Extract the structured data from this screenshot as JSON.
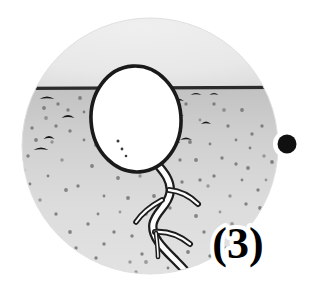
{
  "figure": {
    "stage_label": "(3)",
    "caption_text": "(3)",
    "scene_kind": "cross-section-soil-circle",
    "colors": {
      "background": "#ffffff",
      "sky": "#e9e9e9",
      "sky_edge": "#dcdcdc",
      "soil_top": "#c2c2c2",
      "soil_bottom": "#e2e2e2",
      "soil_line": "#2b2b2b",
      "outline": "#1a1a1a",
      "seed_fill": "#ffffff",
      "root_fill": "#fdfdfd",
      "speckle": "#6f6f6f",
      "pebble": "#171717",
      "bullet_dot": "#101010",
      "halo": "#ffffff",
      "caption_fill": "#000000"
    },
    "circle": {
      "cx": 150,
      "cy": 146,
      "r": 128
    },
    "soil_line_y": 88,
    "seed": {
      "name": "seed",
      "cx": 136,
      "cy": 119,
      "rx": 45,
      "ry": 53,
      "fill": "#ffffff",
      "stroke": "#1a1a1a"
    },
    "bullet": {
      "cx": 287,
      "cy": 144,
      "r": 9.5,
      "halo_r": 14
    },
    "caption": {
      "x": 238,
      "y": 258,
      "font_size": 44
    },
    "speckles": [
      [
        46,
        118
      ],
      [
        58,
        104
      ],
      [
        70,
        131
      ],
      [
        84,
        112
      ],
      [
        96,
        145
      ],
      [
        62,
        160
      ],
      [
        48,
        176
      ],
      [
        78,
        186
      ],
      [
        92,
        166
      ],
      [
        104,
        196
      ],
      [
        40,
        200
      ],
      [
        56,
        214
      ],
      [
        70,
        232
      ],
      [
        88,
        224
      ],
      [
        104,
        244
      ],
      [
        120,
        212
      ],
      [
        118,
        178
      ],
      [
        108,
        160
      ],
      [
        126,
        152
      ],
      [
        132,
        236
      ],
      [
        146,
        262
      ],
      [
        160,
        238
      ],
      [
        170,
        208
      ],
      [
        182,
        182
      ],
      [
        196,
        160
      ],
      [
        208,
        186
      ],
      [
        222,
        158
      ],
      [
        236,
        140
      ],
      [
        248,
        168
      ],
      [
        258,
        190
      ],
      [
        220,
        212
      ],
      [
        204,
        232
      ],
      [
        188,
        252
      ],
      [
        168,
        268
      ],
      [
        150,
        278
      ],
      [
        130,
        262
      ],
      [
        112,
        272
      ],
      [
        96,
        258
      ],
      [
        76,
        248
      ],
      [
        60,
        246
      ],
      [
        44,
        232
      ],
      [
        34,
        214
      ],
      [
        30,
        184
      ],
      [
        28,
        156
      ],
      [
        36,
        140
      ],
      [
        200,
        120
      ],
      [
        214,
        104
      ],
      [
        228,
        126
      ],
      [
        242,
        110
      ],
      [
        252,
        134
      ],
      [
        264,
        156
      ],
      [
        178,
        128
      ],
      [
        190,
        142
      ],
      [
        164,
        104
      ],
      [
        152,
        134
      ],
      [
        140,
        176
      ],
      [
        154,
        196
      ],
      [
        176,
        236
      ],
      [
        192,
        200
      ],
      [
        210,
        256
      ],
      [
        232,
        224
      ],
      [
        246,
        204
      ],
      [
        256,
        222
      ],
      [
        84,
        140
      ],
      [
        66,
        190
      ],
      [
        52,
        142
      ],
      [
        98,
        214
      ],
      [
        114,
        232
      ],
      [
        128,
        198
      ],
      [
        242,
        180
      ],
      [
        230,
        196
      ],
      [
        214,
        176
      ],
      [
        196,
        216
      ],
      [
        180,
        160
      ],
      [
        166,
        180
      ],
      [
        266,
        180
      ],
      [
        260,
        208
      ],
      [
        244,
        244
      ],
      [
        226,
        248
      ],
      [
        206,
        270
      ],
      [
        186,
        276
      ],
      [
        158,
        218
      ],
      [
        142,
        254
      ],
      [
        124,
        286
      ],
      [
        104,
        280
      ],
      [
        86,
        268
      ],
      [
        68,
        272
      ],
      [
        50,
        258
      ],
      [
        38,
        248
      ],
      [
        26,
        200
      ],
      [
        24,
        170
      ],
      [
        32,
        128
      ],
      [
        44,
        108
      ],
      [
        118,
        118
      ],
      [
        106,
        130
      ],
      [
        94,
        104
      ],
      [
        80,
        98
      ],
      [
        68,
        110
      ],
      [
        56,
        126
      ],
      [
        210,
        144
      ],
      [
        224,
        110
      ],
      [
        236,
        164
      ],
      [
        250,
        148
      ],
      [
        262,
        126
      ],
      [
        272,
        162
      ],
      [
        172,
        150
      ],
      [
        186,
        104
      ],
      [
        200,
        180
      ],
      [
        158,
        164
      ],
      [
        146,
        214
      ],
      [
        136,
        272
      ]
    ],
    "pebbles": [
      {
        "x": 47,
        "y": 99,
        "w": 15,
        "h": 5,
        "rot": -14
      },
      {
        "x": 68,
        "y": 118,
        "w": 13,
        "h": 6,
        "rot": 10
      },
      {
        "x": 49,
        "y": 139,
        "w": 11,
        "h": 6,
        "rot": 22
      },
      {
        "x": 41,
        "y": 150,
        "w": 15,
        "h": 5,
        "rot": 8
      },
      {
        "x": 99,
        "y": 106,
        "w": 10,
        "h": 4,
        "rot": -20
      },
      {
        "x": 178,
        "y": 101,
        "w": 12,
        "h": 5,
        "rot": -22
      },
      {
        "x": 196,
        "y": 95,
        "w": 11,
        "h": 4,
        "rot": 16
      },
      {
        "x": 176,
        "y": 116,
        "w": 16,
        "h": 5,
        "rot": 12
      },
      {
        "x": 206,
        "y": 124,
        "w": 10,
        "h": 5,
        "rot": -8
      },
      {
        "x": 186,
        "y": 140,
        "w": 12,
        "h": 5,
        "rot": 18
      },
      {
        "x": 176,
        "y": 143,
        "w": 9,
        "h": 4,
        "rot": -5
      },
      {
        "x": 214,
        "y": 95,
        "w": 9,
        "h": 4,
        "rot": 28
      }
    ]
  }
}
